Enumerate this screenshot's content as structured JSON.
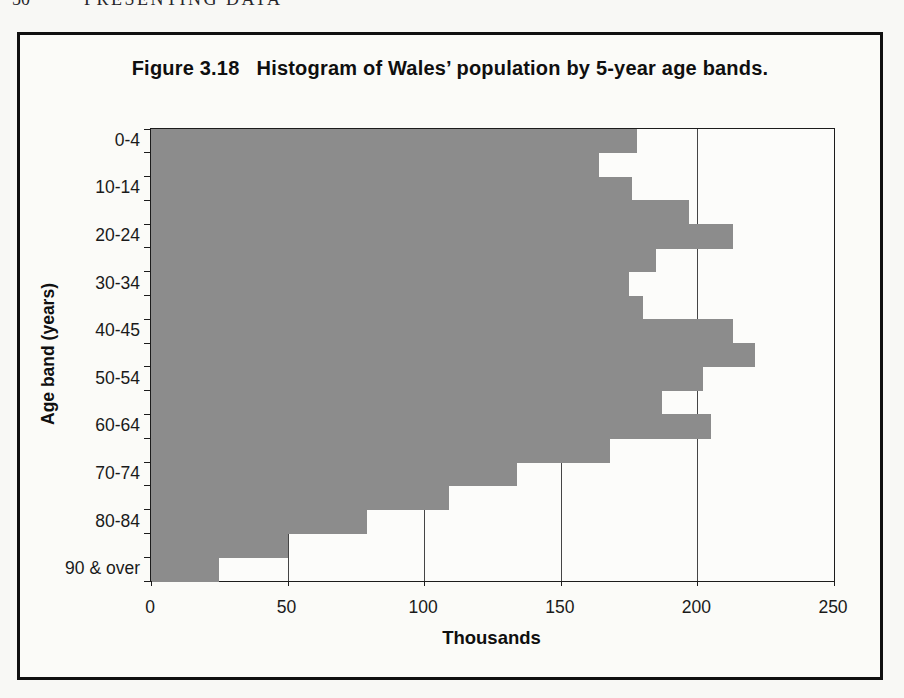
{
  "page": {
    "header": {
      "page_number": "50",
      "running_title": "PRESENTING DATA"
    }
  },
  "figure": {
    "number_label": "Figure 3.18",
    "caption": "Histogram of Wales’ population by 5-year age bands."
  },
  "chart_data": {
    "type": "bar",
    "orientation": "horizontal",
    "categories": [
      "0-4",
      "5-9",
      "10-14",
      "15-19",
      "20-24",
      "25-29",
      "30-34",
      "35-39",
      "40-44",
      "45-49",
      "50-54",
      "55-59",
      "60-64",
      "65-69",
      "70-74",
      "75-79",
      "80-84",
      "85-89",
      "90 & over"
    ],
    "values": [
      178,
      164,
      176,
      197,
      213,
      185,
      175,
      180,
      213,
      221,
      202,
      187,
      205,
      168,
      134,
      109,
      79,
      50,
      25
    ],
    "visible_axis_labels": [
      "0-4",
      "10-14",
      "20-24",
      "30-34",
      "40-45",
      "50-54",
      "60-64",
      "70-74",
      "80-84",
      "90 & over"
    ],
    "xlabel": "Thousands",
    "ylabel": "Age band (years)",
    "xlim": [
      0,
      250
    ],
    "xticks": [
      0,
      50,
      100,
      150,
      200,
      250
    ],
    "grid": "vertical-at-xticks",
    "legend": "none",
    "bar_color": "#8c8c8c",
    "line_color": "#1c1c1c"
  }
}
